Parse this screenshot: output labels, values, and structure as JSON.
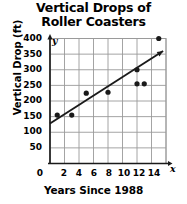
{
  "chart_data": {
    "type": "scatter",
    "title": "Vertical Drops of Roller Coasters",
    "title_line1": "Vertical Drops of",
    "title_line2": "Roller Coasters",
    "xlabel": "Years Since 1988",
    "ylabel": "Vertical Drop (ft)",
    "x_axis_symbol": "x",
    "y_axis_symbol": "y",
    "xlim": [
      0,
      16
    ],
    "ylim": [
      0,
      400
    ],
    "xticks": [
      0,
      2,
      4,
      6,
      8,
      10,
      12,
      14
    ],
    "yticks": [
      50,
      100,
      150,
      200,
      250,
      300,
      350,
      400
    ],
    "grid": true,
    "legend": "none",
    "points": [
      {
        "x": 1,
        "y": 155
      },
      {
        "x": 3,
        "y": 155
      },
      {
        "x": 5,
        "y": 225
      },
      {
        "x": 8,
        "y": 228
      },
      {
        "x": 12,
        "y": 255
      },
      {
        "x": 12,
        "y": 300
      },
      {
        "x": 13,
        "y": 255
      },
      {
        "x": 15,
        "y": 400
      }
    ],
    "trend_line": {
      "name": "line of best fit",
      "x_start": 0,
      "y_start": 128,
      "x_end": 15.6,
      "y_end": 360,
      "arrow_end": true
    },
    "colors": {
      "point": "#1a1a1a",
      "line": "#1a1a1a",
      "grid": "#9a9a9a",
      "axis": "#1a1a1a",
      "text": "#000000",
      "background": "#ffffff"
    }
  }
}
